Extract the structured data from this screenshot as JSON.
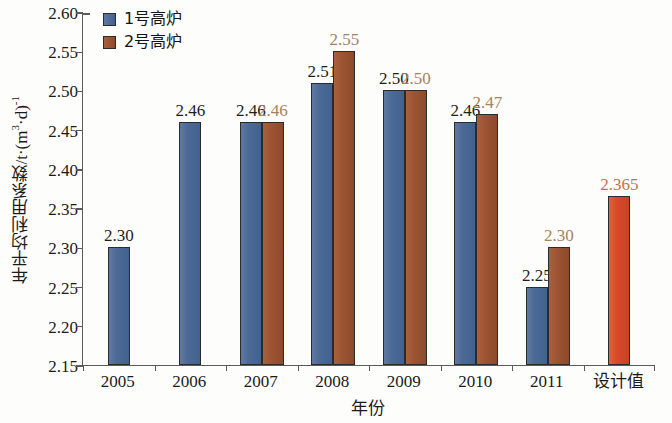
{
  "chart_data": {
    "type": "bar",
    "title": "",
    "xlabel": "年份",
    "ylabel": "年平均利用系数/t·(m³·d)⁻¹",
    "ylabel_main": "年平均利用系数/t·(m",
    "ylabel_sup1": "3",
    "ylabel_mid": "·d)",
    "ylabel_sup2": "-1",
    "ylim": [
      2.15,
      2.6
    ],
    "ytick_step": 0.05,
    "yticks": [
      "2.60",
      "2.55",
      "2.50",
      "2.45",
      "2.40",
      "2.35",
      "2.30",
      "2.25",
      "2.20",
      "2.15"
    ],
    "grid": false,
    "legend_position": "top-left",
    "categories": [
      "2005",
      "2006",
      "2007",
      "2008",
      "2009",
      "2010",
      "2011",
      "设计值"
    ],
    "series": [
      {
        "name": "1号高炉",
        "color": "#4d6a96",
        "label_color": "#1d1d1d",
        "values": [
          2.3,
          2.46,
          2.46,
          2.51,
          2.5,
          2.46,
          2.25,
          null
        ],
        "labels": [
          "2.30",
          "2.46",
          "2.46",
          "2.51",
          "2.50",
          "2.46",
          "2.25",
          ""
        ]
      },
      {
        "name": "2号高炉",
        "color": "#9c5433",
        "label_color": "#a6825f",
        "values": [
          null,
          null,
          2.46,
          2.55,
          2.5,
          2.47,
          2.3,
          null
        ],
        "labels": [
          "",
          "",
          "2.46",
          "2.55",
          "2.50",
          "2.47",
          "2.30",
          ""
        ]
      },
      {
        "name": "设计值",
        "color": "#d9492a",
        "label_color": "#c4733f",
        "values": [
          null,
          null,
          null,
          null,
          null,
          null,
          null,
          2.365
        ],
        "labels": [
          "",
          "",
          "",
          "",
          "",
          "",
          "",
          "2.365"
        ]
      }
    ]
  },
  "legend": {
    "items": [
      {
        "label": "1号高炉",
        "color": "#4d6a96"
      },
      {
        "label": "2号高炉",
        "color": "#9c5433"
      }
    ]
  }
}
